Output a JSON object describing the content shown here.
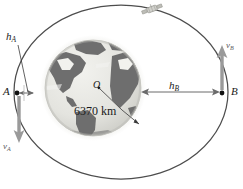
{
  "figure": {
    "type": "physics-diagram"
  },
  "labels": {
    "point_a": "A",
    "point_b": "B",
    "altitude_a_main": "h",
    "altitude_a_sub": "A",
    "altitude_b_main": "h",
    "altitude_b_sub": "B",
    "velocity_a_main": "v",
    "velocity_a_sub": "A",
    "velocity_b_main": "v",
    "velocity_b_sub": "B",
    "center": "O",
    "earth_radius": "6370 km"
  },
  "icons": {
    "satellite": "satellite-icon",
    "earth": "earth-globe-icon",
    "point_marker_a": "point-dot-icon",
    "point_marker_b": "point-dot-icon",
    "arrow_velocity_a": "arrow-down-icon",
    "arrow_velocity_b": "arrow-up-icon",
    "arrow_altitude_b": "double-arrow-horizontal-icon",
    "arrow_altitude_a": "double-arrow-horizontal-icon",
    "leader_line_center": "leader-line-icon",
    "leader_line_radius": "leader-line-icon",
    "leader_line_ha": "leader-line-icon"
  },
  "colors": {
    "orbit_stroke": "#4d4d4d",
    "earth_ocean": "#e2e2dd",
    "earth_land": "#6e6e6e",
    "earth_land_light": "#f2f2ee",
    "earth_halo": "#ededea",
    "velocity_arrow": "#9a9a9a",
    "dimension_arrow": "#6b6b6b",
    "text": "#1a1a1a",
    "background": "#ffffff"
  },
  "geometry": {
    "orbit_center_x": 121,
    "orbit_center_y": 92,
    "orbit_rx": 107,
    "orbit_ry": 87,
    "earth_center_x": 93,
    "earth_center_y": 88,
    "earth_radius_px": 48,
    "point_a_x": 17,
    "point_a_y": 93,
    "point_b_x": 222,
    "point_b_y": 93
  }
}
